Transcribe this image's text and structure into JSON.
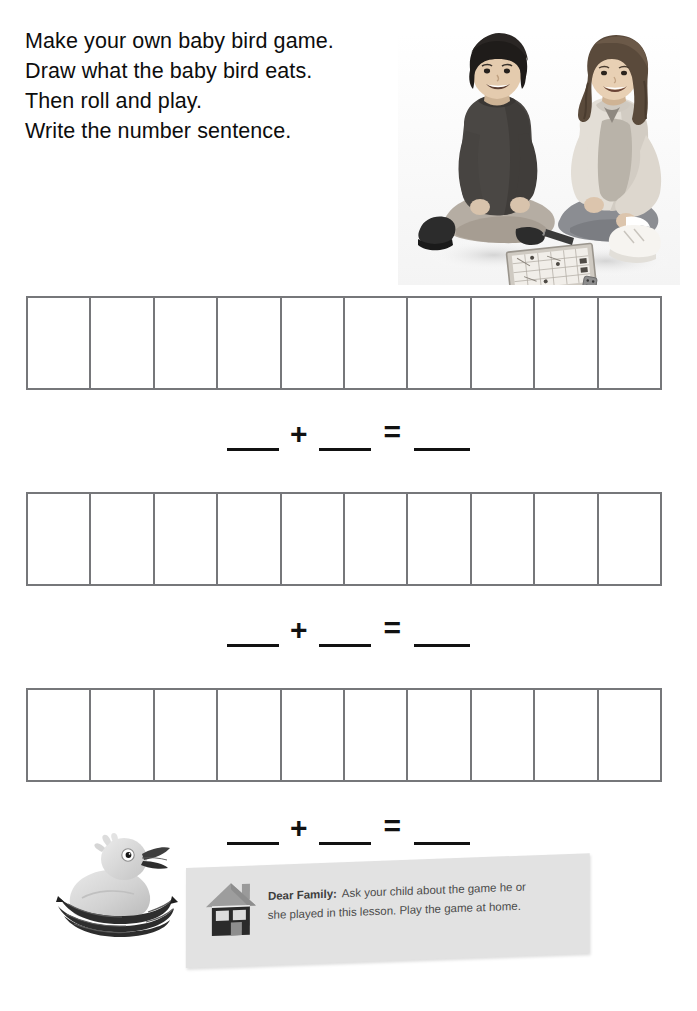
{
  "page": {
    "width": 697,
    "height": 1011,
    "background": "#ffffff"
  },
  "instructions": {
    "lines": [
      "Make your own baby bird game.",
      "Draw what the baby bird eats.",
      "Then roll and play.",
      "Write the number sentence."
    ]
  },
  "photo": {
    "alt": "Two children sitting on the floor playing a board game with a die",
    "style": "black-and-white photograph"
  },
  "grids": [
    {
      "id": "grid-1",
      "cells": 10
    },
    {
      "id": "grid-2",
      "cells": 10
    },
    {
      "id": "grid-3",
      "cells": 10
    }
  ],
  "number_sentences": [
    {
      "plus": "+",
      "equals": "="
    },
    {
      "plus": "+",
      "equals": "="
    },
    {
      "plus": "+",
      "equals": "="
    }
  ],
  "bird": {
    "alt": "Baby bird sitting in a nest with open beak"
  },
  "family_note": {
    "icon": "house-icon",
    "label": "Dear Family:",
    "lines": [
      "Ask your child about the game he or",
      "she played in this lesson. Play the game at home."
    ],
    "line1_rest": "Ask your child about the game he or",
    "line2": "she played in this lesson. Play the game at home."
  },
  "colors": {
    "grid_border": "#76777a",
    "text": "#0d0d0d",
    "rule_line": "#111111",
    "note_background": "#e2e2e2",
    "note_text": "#4a4a4a"
  }
}
